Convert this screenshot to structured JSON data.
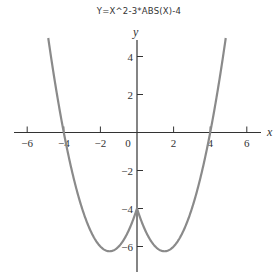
{
  "chart_data": {
    "type": "line",
    "title": "Y=X^2-3*ABS(X)-4",
    "xlabel": "x",
    "ylabel": "y",
    "function": "y = x^2 - 3|x| - 4",
    "xlim": [
      -6.8,
      6.8
    ],
    "ylim": [
      -7.5,
      5.0
    ],
    "x_ticks": [
      -6,
      -4,
      -2,
      0,
      2,
      4,
      6
    ],
    "x_tick_labels": [
      "−6",
      "−4",
      "−2",
      "0",
      "2",
      "4",
      "6"
    ],
    "y_ticks": [
      4,
      2,
      -2,
      -4,
      -6
    ],
    "y_tick_labels": [
      "4",
      "2",
      "−2",
      "−4",
      "−6"
    ],
    "grid": false,
    "legend": null,
    "series": [
      {
        "name": "y = x^2 - 3|x| - 4",
        "color": "#8a8a8a",
        "x": [
          -4.85,
          -4.5,
          -4,
          -3.5,
          -3,
          -2.5,
          -2,
          -1.5,
          -1,
          -0.5,
          0,
          0.5,
          1,
          1.5,
          2,
          2.5,
          3,
          3.5,
          4,
          4.5,
          4.85
        ],
        "y": [
          4.97,
          2.75,
          0,
          -2.25,
          -4,
          -5.25,
          -6,
          -6.25,
          -6,
          -5.25,
          -4,
          -5.25,
          -6,
          -6.25,
          -6,
          -5.25,
          -4,
          -2.25,
          0,
          2.75,
          4.97
        ]
      }
    ],
    "key_points": {
      "x_intercepts": [
        -4,
        4
      ],
      "y_intercept": -4,
      "minima": [
        [
          -1.5,
          -6.25
        ],
        [
          1.5,
          -6.25
        ]
      ]
    }
  },
  "colors": {
    "axis": "#333333",
    "curve": "#8a8a8a"
  }
}
